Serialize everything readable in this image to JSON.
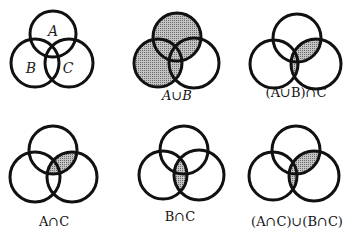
{
  "colors": {
    "stroke": "#111111",
    "shade": "#9a9a9a",
    "background": "#ffffff"
  },
  "diagrams": [
    {
      "id": "base",
      "label": "",
      "region_labels": {
        "A": "A",
        "B": "B",
        "C": "C"
      },
      "shaded": "none"
    },
    {
      "id": "union-ab",
      "label": "A∪B",
      "shaded": "A or B"
    },
    {
      "id": "union-ab-intersect-c",
      "label": "(A∪B)∩C",
      "shaded": "(A or B) and C"
    },
    {
      "id": "intersect-ac",
      "label": "A∩C",
      "shaded": "A and C"
    },
    {
      "id": "intersect-bc",
      "label": "B∩C",
      "shaded": "B and C"
    },
    {
      "id": "union-ac-bc",
      "label": "(A∩C)∪(B∩C)",
      "shaded": "(A and C) or (B and C)"
    }
  ]
}
